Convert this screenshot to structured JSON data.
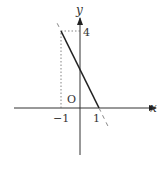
{
  "figure": {
    "function": "y = -2x + 2",
    "axes": {
      "x_label": "x",
      "y_label": "y",
      "origin_label": "O"
    },
    "tick_labels": {
      "x_neg_one": "−1",
      "x_one": "1",
      "y_four": "4"
    },
    "solid_segment": {
      "from": [
        -1,
        4
      ],
      "to": [
        1,
        0
      ]
    },
    "dashed_extension_upper": {
      "from": [
        -1.2,
        4.4
      ],
      "to": [
        -1,
        4
      ]
    },
    "dashed_extension_lower": {
      "from": [
        1,
        0
      ],
      "to": [
        1.55,
        -1.1
      ]
    },
    "guide_lines": [
      {
        "from": [
          -1,
          0
        ],
        "to": [
          -1,
          4
        ],
        "style": "dotted"
      },
      {
        "from": [
          -1,
          4
        ],
        "to": [
          0,
          4
        ],
        "style": "dotted"
      }
    ],
    "x_range": [
      -3,
      4
    ],
    "y_range": [
      -3,
      5
    ],
    "colors": {
      "axis": "#333333",
      "line": "#222222",
      "dashed": "#888888",
      "guide": "#666666"
    }
  }
}
